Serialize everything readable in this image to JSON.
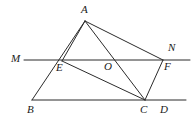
{
  "figure": {
    "width": 193,
    "height": 124,
    "background_color": "#ffffff",
    "stroke_color": "#2b2b2b",
    "label_color": "#1a1a1a"
  },
  "labels": {
    "A": "A",
    "M": "M",
    "N": "N",
    "E": "E",
    "O": "O",
    "F": "F",
    "B": "B",
    "C": "C",
    "D": "D"
  },
  "points": {
    "A": {
      "x": 85,
      "y": 21
    },
    "M": {
      "x": 24,
      "y": 60
    },
    "N": {
      "x": 190,
      "y": 60
    },
    "E": {
      "x": 62,
      "y": 60
    },
    "O": {
      "x": 112,
      "y": 60
    },
    "F": {
      "x": 163,
      "y": 60
    },
    "B": {
      "x": 32,
      "y": 100
    },
    "C": {
      "x": 145,
      "y": 100
    },
    "D": {
      "x": 186,
      "y": 100
    }
  },
  "segments": [
    {
      "name": "line-MN",
      "from": "M",
      "to": "N"
    },
    {
      "name": "line-BD",
      "from": "B",
      "to": "D"
    },
    {
      "name": "segment-AB",
      "from": "A",
      "to": "B"
    },
    {
      "name": "segment-AE",
      "from": "A",
      "to": "E"
    },
    {
      "name": "segment-AC",
      "from": "A",
      "to": "C"
    },
    {
      "name": "segment-AF",
      "from": "A",
      "to": "F"
    },
    {
      "name": "segment-EC",
      "from": "E",
      "to": "C"
    },
    {
      "name": "segment-FC",
      "from": "F",
      "to": "C"
    }
  ]
}
